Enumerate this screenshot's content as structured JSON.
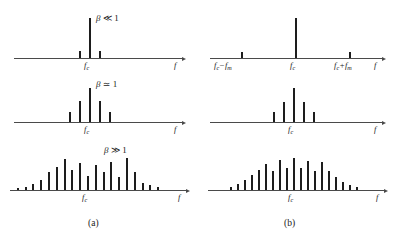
{
  "figure": {
    "captions": [
      {
        "id": "caption-a",
        "text": "(a)"
      },
      {
        "id": "caption-b",
        "text": "(b)"
      }
    ],
    "axis_frequency_symbol": "f",
    "center_frequency_label": "f_c",
    "lower_sideband_label": "f_c − f_m",
    "upper_sideband_label": "f_c + f_m",
    "ink_color": "#1d1d1d",
    "axis_color": "#4a4a4a",
    "background_color": "#ffffff"
  },
  "labels": {
    "f": "f",
    "f_c_base": "f",
    "f_c_sub": "c",
    "f_m_sub": "m",
    "minus": "−",
    "plus": "+",
    "beta": "β",
    "much_less": "≪",
    "approx_equal": "≃",
    "much_greater": "≫",
    "one": "1"
  },
  "chart_data": [
    {
      "id": "panel-a-1",
      "type": "bar",
      "title": "β ≪ 1",
      "column": "a",
      "xlabel": "f",
      "ylabel": "",
      "center_label": "f_c",
      "grid": false,
      "legend": false,
      "annotation": "Narrowband FM: carrier plus one pair of small sidebands",
      "x": [
        -1,
        0,
        1
      ],
      "values": [
        0.17,
        1.0,
        0.17
      ],
      "center_index": 1,
      "spacing_px": 10,
      "max_height_px": 40
    },
    {
      "id": "panel-a-2",
      "type": "bar",
      "title": "β ≃ 1",
      "column": "a",
      "xlabel": "f",
      "ylabel": "",
      "center_label": "f_c",
      "grid": false,
      "legend": false,
      "annotation": "Intermediate FM: carrier with two significant sideband pairs",
      "x": [
        -2,
        -1,
        0,
        1,
        2
      ],
      "values": [
        0.3,
        0.62,
        1.0,
        0.62,
        0.3
      ],
      "center_index": 2,
      "spacing_px": 10,
      "max_height_px": 34
    },
    {
      "id": "panel-a-3",
      "type": "bar",
      "title": "β ≫ 1",
      "column": "a",
      "xlabel": "f",
      "ylabel": "",
      "center_label": "f_c",
      "grid": false,
      "legend": false,
      "annotation": "Wideband FM: many sidebands with oscillating Bessel envelope",
      "x": [
        -9,
        -8,
        -7,
        -6,
        -5,
        -4,
        -3,
        -2,
        -1,
        0,
        1,
        2,
        3,
        4,
        5,
        6,
        7,
        8,
        9
      ],
      "values": [
        0.07,
        0.1,
        0.2,
        0.32,
        0.55,
        0.72,
        0.97,
        0.62,
        0.85,
        0.45,
        0.78,
        0.55,
        0.86,
        0.42,
        1.0,
        0.55,
        0.22,
        0.15,
        0.09
      ],
      "center_index": 9,
      "spacing_px": 7.8,
      "max_height_px": 32
    },
    {
      "id": "panel-b-1",
      "type": "bar",
      "title": "",
      "column": "b",
      "xlabel": "f",
      "ylabel": "",
      "center_label": "f_c",
      "left_label": "f_c − f_m",
      "right_label": "f_c + f_m",
      "grid": false,
      "legend": false,
      "annotation": "AM-like spectrum: carrier with one widely spaced sideband pair",
      "x": [
        -1,
        0,
        1
      ],
      "values": [
        0.16,
        1.0,
        0.16
      ],
      "center_index": 1,
      "spacing_px": 54,
      "max_height_px": 40
    },
    {
      "id": "panel-b-2",
      "type": "bar",
      "title": "",
      "column": "b",
      "xlabel": "f",
      "ylabel": "",
      "center_label": "f_c",
      "grid": false,
      "legend": false,
      "annotation": "Carrier with two tapering sideband pairs",
      "x": [
        -2,
        -1,
        0,
        1,
        2
      ],
      "values": [
        0.28,
        0.6,
        1.0,
        0.6,
        0.28
      ],
      "center_index": 2,
      "spacing_px": 10,
      "max_height_px": 34
    },
    {
      "id": "panel-b-3",
      "type": "bar",
      "title": "",
      "column": "b",
      "xlabel": "f",
      "ylabel": "",
      "center_label": "f_c",
      "grid": false,
      "legend": false,
      "annotation": "Dense cluster of many sidebands",
      "x": [
        -9,
        -8,
        -7,
        -6,
        -5,
        -4,
        -3,
        -2,
        -1,
        0,
        1,
        2,
        3,
        4,
        5,
        6,
        7,
        8,
        9
      ],
      "values": [
        0.1,
        0.18,
        0.3,
        0.46,
        0.62,
        0.8,
        0.58,
        0.95,
        0.7,
        1.0,
        0.68,
        0.9,
        0.6,
        0.86,
        0.6,
        0.4,
        0.26,
        0.16,
        0.1
      ],
      "center_index": 9,
      "spacing_px": 7.0,
      "max_height_px": 32
    }
  ]
}
